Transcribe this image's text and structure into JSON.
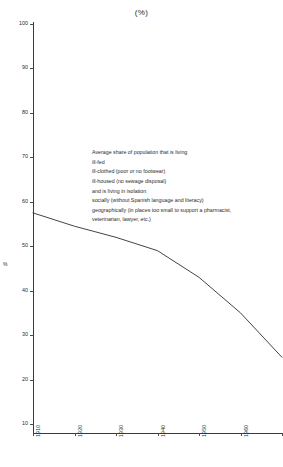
{
  "chart_data": {
    "type": "line",
    "title": "(%)",
    "xlabel": "",
    "ylabel": "%",
    "ylim": [
      10,
      100
    ],
    "xlim": [
      1910,
      1970
    ],
    "grid": false,
    "legend": null,
    "yticks": [
      100,
      90,
      80,
      70,
      60,
      50,
      40,
      30,
      20,
      10
    ],
    "xticks": [
      1910,
      1920,
      1930,
      1940,
      1950,
      1960,
      1970
    ],
    "x": [
      1910,
      1920,
      1930,
      1940,
      1950,
      1960,
      1970
    ],
    "values": [
      57.5,
      54.5,
      52.0,
      49.0,
      43.0,
      35.0,
      25.0
    ],
    "series": [
      {
        "name": "Average share of population that is living ill-fed, ill-clothed, ill-housed and in isolation",
        "values": [
          57.5,
          54.5,
          52.0,
          49.0,
          43.0,
          35.0,
          25.0
        ]
      }
    ],
    "annotations": [
      {
        "indent": 0,
        "text": "Average share of population that is living"
      },
      {
        "indent": 1,
        "text": "ill-fed"
      },
      {
        "indent": 1,
        "text": "ill-clothed (poor or no footwear)"
      },
      {
        "indent": 1,
        "text": "ill-housed (no sewage disposal)"
      },
      {
        "indent": 2,
        "text": "and is living in isolation"
      },
      {
        "indent": 3,
        "text": "socially (without Spanish language and literacy)"
      },
      {
        "indent": 3,
        "text": "geographically (in places too small to support a pharmacist,"
      },
      {
        "indent": 4,
        "text": "veterinarian, lawyer, etc.)"
      }
    ],
    "line_color": "#2f2f2f",
    "axis_color": "#3a3a3a"
  }
}
